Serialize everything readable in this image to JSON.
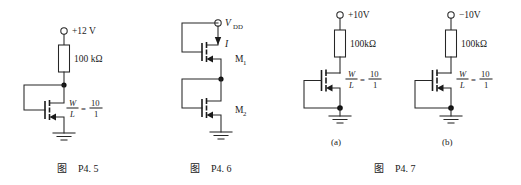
{
  "page": {
    "width": 521,
    "height": 185,
    "background": "#ffffff",
    "ink": "#1a1a1a"
  },
  "figures": [
    {
      "id": "P4.5",
      "caption_cn": "图",
      "caption_num": "P4. 5",
      "supply_label": "+12 V",
      "resistor_label": "100 kΩ",
      "ratio": {
        "lhs_num": "W",
        "lhs_den": "L",
        "equals": "=",
        "rhs_num": "10",
        "rhs_den": "1"
      },
      "device": "nmos-diode-connected",
      "ground": "ground-symbol"
    },
    {
      "id": "P4.6",
      "caption_cn": "图",
      "caption_num": "P4. 6",
      "supply_label": "V",
      "supply_sub": "DD",
      "current_label": "I",
      "transistors": [
        {
          "name": "M",
          "sub": "1"
        },
        {
          "name": "M",
          "sub": "2"
        }
      ],
      "ground": "ground-symbol"
    },
    {
      "id": "P4.7",
      "caption_cn": "图",
      "caption_num": "P4. 7",
      "subfigures": [
        {
          "tag": "(a)",
          "supply_label": "+10V",
          "resistor_label": "100kΩ",
          "ratio": {
            "lhs_num": "W",
            "lhs_den": "L",
            "equals": "=",
            "rhs_num": "10",
            "rhs_den": "1"
          },
          "ground": "ground-symbol"
        },
        {
          "tag": "(b)",
          "supply_label": "−10V",
          "resistor_label": "100kΩ",
          "ratio": {
            "lhs_num": "W",
            "lhs_den": "L",
            "equals": "=",
            "rhs_num": "10",
            "rhs_den": "1"
          },
          "ground": "ground-symbol"
        }
      ]
    }
  ]
}
